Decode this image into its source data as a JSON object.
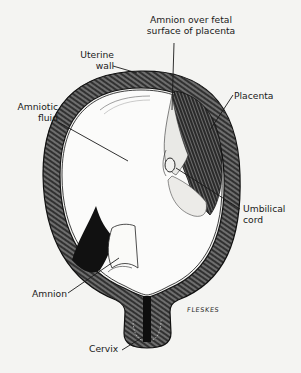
{
  "figure": {
    "type": "anatomical-illustration",
    "background_color": "#f4f4f2",
    "ink_color": "#1a1a1a"
  },
  "labels": {
    "amnion_over_placenta": {
      "line1": "Amnion over fetal",
      "line2": "surface of placenta"
    },
    "uterine_wall": {
      "line1": "Uterine",
      "line2": "wall"
    },
    "amniotic_fluid": {
      "line1": "Amniotic",
      "line2": "fluid"
    },
    "placenta": {
      "line1": "Placenta"
    },
    "umbilical_cord": {
      "line1": "Umbilical",
      "line2": "cord"
    },
    "amnion": {
      "line1": "Amnion"
    },
    "cervix": {
      "line1": "Cervix"
    }
  },
  "signature": "FLESKES"
}
